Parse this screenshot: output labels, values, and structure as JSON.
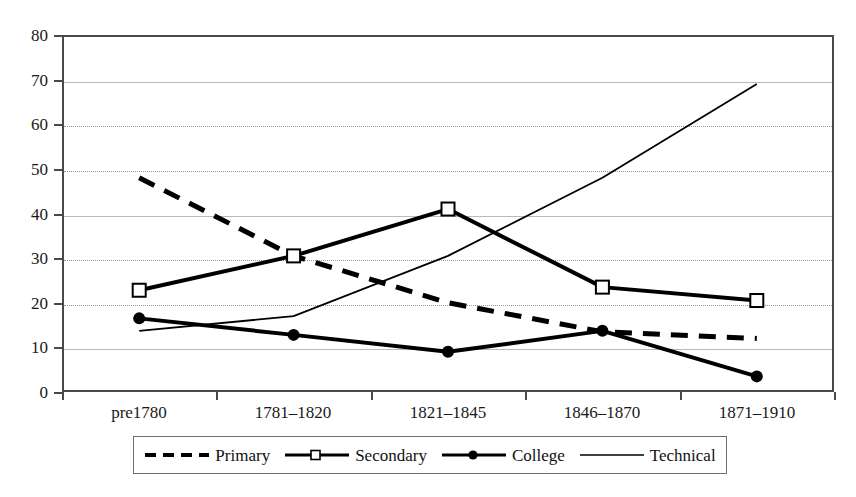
{
  "chart_data": {
    "type": "line",
    "title": "",
    "xlabel": "",
    "ylabel": "",
    "categories": [
      "pre1780",
      "1781–1820",
      "1821–1845",
      "1846–1870",
      "1871–1910"
    ],
    "ylim": [
      0,
      80
    ],
    "yticks": [
      0,
      10,
      20,
      30,
      40,
      50,
      60,
      70,
      80
    ],
    "ytick_labels": [
      "0",
      "10",
      "20",
      "30",
      "40",
      "50",
      "60",
      "70",
      "80"
    ],
    "grid": true,
    "legend_position": "bottom",
    "series": [
      {
        "name": "Primary",
        "style": "dashed",
        "marker": "none",
        "color": "#000000",
        "values": [
          48,
          30.5,
          20,
          13.5,
          12
        ]
      },
      {
        "name": "Secondary",
        "style": "solid-thick",
        "marker": "open-square",
        "color": "#000000",
        "values": [
          22.8,
          30.5,
          41,
          23.5,
          20.5
        ]
      },
      {
        "name": "College",
        "style": "solid-thick",
        "marker": "filled-circle",
        "color": "#000000",
        "values": [
          16.5,
          12.8,
          9,
          13.7,
          3.5
        ]
      },
      {
        "name": "Technical",
        "style": "solid-thin",
        "marker": "none",
        "color": "#000000",
        "values": [
          13.7,
          17,
          30.5,
          48,
          69
        ]
      }
    ]
  },
  "axis": {
    "y_tick_labels": [
      "80",
      "70",
      "60",
      "50",
      "40",
      "30",
      "20",
      "10",
      "0"
    ],
    "x_tick_labels": [
      "pre1780",
      "1781–1820",
      "1821–1845",
      "1846–1870",
      "1871–1910"
    ]
  },
  "legend": {
    "entries": [
      {
        "label": "Primary",
        "sample": "dashed-line-sample"
      },
      {
        "label": "Secondary",
        "sample": "line-open-square-sample"
      },
      {
        "label": "College",
        "sample": "line-filled-circle-sample"
      },
      {
        "label": "Technical",
        "sample": "thin-line-sample"
      }
    ]
  },
  "colors": {
    "ink": "#000000",
    "axis": "#4a4a4a",
    "grid": "#9a9a9a",
    "background": "#ffffff"
  }
}
